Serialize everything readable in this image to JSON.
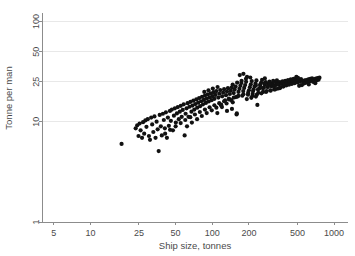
{
  "chart_data": {
    "type": "scatter",
    "title": "",
    "subtitle": "",
    "xlabel": "Ship size, tonnes",
    "ylabel": "Tonne per man",
    "xscale": "log",
    "yscale": "log",
    "xlim": [
      4.0,
      1300.0
    ],
    "ylim": [
      1.0,
      130.0
    ],
    "xticks": [
      5,
      10,
      25,
      50,
      100,
      200,
      500,
      1000
    ],
    "xtick_labels": [
      "5",
      "10",
      "25",
      "50",
      "100",
      "200",
      "500",
      "1000"
    ],
    "yticks": [
      1,
      10,
      25,
      50,
      100
    ],
    "ytick_labels": [
      "1",
      "10",
      "25",
      "50",
      "100"
    ],
    "grid": "horizontal",
    "legend": "none",
    "marker": {
      "shape": "circle",
      "color": "#111111",
      "size": 2.1
    },
    "annotations": [],
    "n_points": 262,
    "points": [
      [
        18.0,
        6.0
      ],
      [
        23.5,
        8.6
      ],
      [
        24.2,
        9.2
      ],
      [
        24.8,
        7.2
      ],
      [
        25.3,
        9.6
      ],
      [
        25.8,
        8.2
      ],
      [
        26.5,
        6.9
      ],
      [
        27.0,
        9.9
      ],
      [
        27.6,
        7.6
      ],
      [
        28.2,
        10.3
      ],
      [
        28.8,
        8.9
      ],
      [
        29.5,
        10.6
      ],
      [
        30.2,
        7.2
      ],
      [
        30.8,
        6.6
      ],
      [
        31.5,
        11.0
      ],
      [
        32.1,
        9.4
      ],
      [
        32.8,
        7.9
      ],
      [
        33.5,
        11.3
      ],
      [
        34.2,
        6.9
      ],
      [
        34.9,
        10.0
      ],
      [
        35.6,
        8.4
      ],
      [
        36.3,
        5.1
      ],
      [
        37.0,
        11.7
      ],
      [
        37.8,
        9.0
      ],
      [
        38.5,
        7.3
      ],
      [
        39.3,
        12.0
      ],
      [
        40.0,
        10.4
      ],
      [
        40.8,
        8.6
      ],
      [
        41.6,
        12.4
      ],
      [
        42.4,
        6.9
      ],
      [
        43.2,
        11.0
      ],
      [
        44.0,
        9.1
      ],
      [
        44.9,
        12.8
      ],
      [
        45.7,
        10.2
      ],
      [
        46.6,
        13.2
      ],
      [
        47.5,
        8.2
      ],
      [
        48.4,
        11.5
      ],
      [
        49.3,
        13.6
      ],
      [
        50.2,
        9.8
      ],
      [
        51.2,
        12.1
      ],
      [
        52.1,
        14.0
      ],
      [
        53.1,
        10.6
      ],
      [
        54.1,
        12.6
      ],
      [
        55.1,
        14.4
      ],
      [
        56.1,
        11.2
      ],
      [
        57.2,
        13.1
      ],
      [
        58.2,
        14.9
      ],
      [
        59.3,
        7.3
      ],
      [
        60.4,
        12.0
      ],
      [
        61.5,
        13.6
      ],
      [
        62.7,
        15.3
      ],
      [
        63.8,
        11.2
      ],
      [
        65.0,
        14.1
      ],
      [
        66.2,
        15.8
      ],
      [
        67.4,
        12.6
      ],
      [
        68.7,
        14.5
      ],
      [
        69.9,
        16.2
      ],
      [
        71.2,
        13.2
      ],
      [
        72.5,
        15.0
      ],
      [
        73.9,
        16.7
      ],
      [
        75.2,
        13.8
      ],
      [
        76.6,
        15.5
      ],
      [
        78.0,
        17.2
      ],
      [
        79.4,
        14.3
      ],
      [
        80.9,
        16.0
      ],
      [
        82.4,
        17.7
      ],
      [
        83.9,
        14.9
      ],
      [
        85.4,
        16.5
      ],
      [
        87.0,
        18.2
      ],
      [
        88.6,
        15.4
      ],
      [
        90.2,
        17.0
      ],
      [
        91.8,
        18.7
      ],
      [
        93.5,
        15.9
      ],
      [
        95.2,
        17.5
      ],
      [
        97.0,
        19.2
      ],
      [
        98.7,
        16.4
      ],
      [
        100.5,
        18.0
      ],
      [
        102.4,
        19.7
      ],
      [
        104.2,
        16.9
      ],
      [
        106.1,
        18.5
      ],
      [
        108.1,
        20.2
      ],
      [
        110.0,
        12.2
      ],
      [
        112.1,
        17.4
      ],
      [
        114.1,
        19.0
      ],
      [
        116.2,
        20.7
      ],
      [
        118.3,
        14.8
      ],
      [
        120.5,
        17.9
      ],
      [
        122.7,
        19.5
      ],
      [
        125.0,
        21.1
      ],
      [
        127.3,
        16.3
      ],
      [
        129.6,
        18.4
      ],
      [
        132.0,
        20.0
      ],
      [
        134.4,
        21.6
      ],
      [
        136.9,
        17.0
      ],
      [
        139.4,
        18.9
      ],
      [
        141.9,
        20.4
      ],
      [
        144.5,
        22.0
      ],
      [
        147.2,
        15.6
      ],
      [
        149.9,
        19.3
      ],
      [
        152.6,
        20.9
      ],
      [
        155.4,
        22.4
      ],
      [
        158.2,
        11.8
      ],
      [
        161.1,
        17.8
      ],
      [
        164.0,
        19.8
      ],
      [
        167.0,
        21.3
      ],
      [
        170.0,
        22.8
      ],
      [
        173.1,
        24.3
      ],
      [
        176.3,
        18.2
      ],
      [
        179.5,
        20.2
      ],
      [
        182.7,
        21.7
      ],
      [
        186.0,
        23.2
      ],
      [
        189.4,
        25.0
      ],
      [
        192.8,
        28.0
      ],
      [
        196.3,
        18.6
      ],
      [
        199.8,
        20.6
      ],
      [
        203.4,
        22.1
      ],
      [
        207.1,
        23.6
      ],
      [
        210.8,
        25.4
      ],
      [
        214.6,
        19.0
      ],
      [
        218.4,
        21.0
      ],
      [
        222.3,
        22.5
      ],
      [
        226.3,
        24.0
      ],
      [
        230.3,
        25.8
      ],
      [
        234.4,
        14.7
      ],
      [
        238.6,
        19.4
      ],
      [
        242.9,
        21.4
      ],
      [
        247.2,
        22.9
      ],
      [
        251.6,
        24.4
      ],
      [
        256.0,
        26.1
      ],
      [
        260.6,
        19.8
      ],
      [
        265.2,
        21.8
      ],
      [
        269.9,
        23.3
      ],
      [
        274.7,
        24.8
      ],
      [
        279.6,
        20.2
      ],
      [
        284.5,
        22.2
      ],
      [
        289.6,
        23.7
      ],
      [
        294.7,
        25.1
      ],
      [
        299.9,
        20.6
      ],
      [
        305.2,
        22.6
      ],
      [
        310.6,
        24.0
      ],
      [
        316.1,
        25.5
      ],
      [
        321.7,
        21.0
      ],
      [
        327.4,
        23.0
      ],
      [
        333.2,
        24.4
      ],
      [
        339.1,
        25.9
      ],
      [
        345.1,
        21.4
      ],
      [
        351.2,
        23.4
      ],
      [
        357.4,
        24.8
      ],
      [
        363.7,
        22.0
      ],
      [
        370.1,
        23.8
      ],
      [
        376.7,
        25.2
      ],
      [
        383.3,
        22.4
      ],
      [
        390.1,
        24.2
      ],
      [
        397.0,
        25.6
      ],
      [
        404.0,
        23.0
      ],
      [
        411.1,
        24.6
      ],
      [
        418.4,
        26.0
      ],
      [
        425.8,
        23.4
      ],
      [
        433.3,
        25.0
      ],
      [
        441.0,
        26.4
      ],
      [
        448.8,
        23.8
      ],
      [
        456.7,
        25.4
      ],
      [
        464.8,
        26.8
      ],
      [
        473.0,
        24.2
      ],
      [
        481.4,
        25.8
      ],
      [
        489.9,
        27.2
      ],
      [
        498.5,
        24.6
      ],
      [
        507.3,
        26.2
      ],
      [
        516.2,
        22.8
      ],
      [
        525.3,
        25.0
      ],
      [
        534.6,
        26.6
      ],
      [
        544.0,
        23.2
      ],
      [
        553.6,
        25.4
      ],
      [
        563.3,
        24.0
      ],
      [
        573.2,
        25.8
      ],
      [
        583.3,
        24.4
      ],
      [
        593.6,
        26.0
      ],
      [
        604.0,
        24.8
      ],
      [
        614.7,
        26.4
      ],
      [
        625.5,
        25.2
      ],
      [
        636.5,
        26.8
      ],
      [
        647.7,
        25.6
      ],
      [
        659.1,
        27.0
      ],
      [
        670.7,
        25.0
      ],
      [
        682.5,
        26.5
      ],
      [
        694.6,
        25.4
      ],
      [
        706.8,
        26.9
      ],
      [
        719.3,
        25.8
      ],
      [
        732.0,
        27.2
      ],
      [
        745.0,
        26.2
      ],
      [
        758.2,
        27.5
      ],
      [
        86.0,
        19.8
      ],
      [
        93.0,
        20.6
      ],
      [
        101.0,
        21.4
      ],
      [
        110.5,
        22.2
      ],
      [
        120.0,
        14.0
      ],
      [
        131.0,
        15.2
      ],
      [
        143.0,
        16.4
      ],
      [
        156.0,
        17.6
      ],
      [
        147.0,
        23.5
      ],
      [
        160.0,
        24.5
      ],
      [
        174.0,
        25.6
      ],
      [
        189.0,
        26.8
      ],
      [
        205.0,
        27.6
      ],
      [
        168.0,
        29.2
      ],
      [
        180.0,
        30.0
      ],
      [
        132.0,
        12.8
      ],
      [
        145.0,
        13.4
      ],
      [
        159.0,
        12.1
      ],
      [
        62.0,
        9.0
      ],
      [
        68.0,
        9.8
      ],
      [
        75.0,
        10.6
      ],
      [
        82.0,
        11.4
      ],
      [
        90.0,
        12.2
      ],
      [
        99.0,
        13.0
      ],
      [
        108.0,
        13.8
      ],
      [
        118.0,
        14.6
      ],
      [
        41.0,
        7.6
      ],
      [
        45.0,
        8.3
      ],
      [
        50.0,
        9.0
      ],
      [
        55.0,
        9.7
      ],
      [
        60.0,
        10.4
      ],
      [
        66.0,
        11.1
      ],
      [
        72.0,
        11.8
      ],
      [
        79.0,
        12.5
      ],
      [
        87.0,
        13.2
      ],
      [
        95.0,
        13.9
      ],
      [
        104.0,
        14.6
      ],
      [
        114.0,
        15.3
      ],
      [
        125.0,
        16.0
      ],
      [
        137.0,
        16.7
      ],
      [
        150.0,
        17.4
      ],
      [
        164.0,
        18.1
      ],
      [
        180.0,
        18.8
      ],
      [
        197.0,
        19.5
      ],
      [
        216.0,
        20.2
      ],
      [
        237.0,
        20.9
      ],
      [
        260.0,
        21.6
      ],
      [
        285.0,
        22.3
      ],
      [
        312.0,
        23.0
      ],
      [
        342.0,
        23.7
      ],
      [
        228.0,
        23.0
      ],
      [
        248.0,
        23.6
      ],
      [
        270.0,
        24.2
      ],
      [
        295.0,
        24.8
      ],
      [
        213.0,
        18.0
      ],
      [
        232.0,
        18.6
      ],
      [
        253.0,
        19.2
      ],
      [
        276.0,
        19.8
      ],
      [
        301.0,
        20.4
      ],
      [
        328.0,
        21.0
      ],
      [
        358.0,
        21.6
      ],
      [
        192.0,
        16.8
      ],
      [
        209.0,
        17.3
      ],
      [
        228.0,
        17.8
      ],
      [
        270.0,
        27.0
      ],
      [
        296.0,
        24.0
      ],
      [
        323.0,
        22.6
      ],
      [
        490.0,
        28.0
      ],
      [
        505.0,
        27.4
      ],
      [
        620.0,
        23.5
      ],
      [
        700.0,
        24.2
      ]
    ]
  },
  "figure": {
    "width": 355,
    "height": 256,
    "background": "#ffffff",
    "plot_area": {
      "left": 42,
      "top": 10,
      "right": 348,
      "bottom": 222
    },
    "axis_color": "#8c8c8c",
    "grid_color": "#e8e8e8",
    "marker_color": "#111111",
    "text_color": "#4a4a4a"
  }
}
